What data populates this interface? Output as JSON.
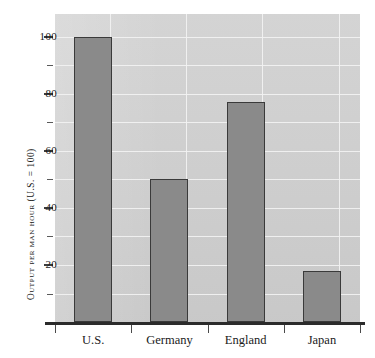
{
  "figure": {
    "top_caption_fragment": "",
    "background_color": "#ffffff",
    "plot_background_color": "#cfcfcf",
    "bar_color": "#8a8a8a",
    "bar_border_color": "#3a3a3a",
    "gridline_color": "#f2f2f2",
    "axis_color": "#2b2b2b"
  },
  "chart_data": {
    "type": "bar",
    "title": "",
    "xlabel": "",
    "ylabel": "Output per man hour (U.S. = 100)",
    "categories": [
      "U.S.",
      "Germany",
      "England",
      "Japan"
    ],
    "values": [
      100,
      50,
      77,
      18
    ],
    "ylim": [
      0,
      108
    ],
    "y_major_ticks": [
      20,
      40,
      60,
      80,
      100
    ],
    "y_minor_ticks": [
      10,
      30,
      50,
      70,
      90
    ],
    "y_tick_labels": [
      "20",
      "40",
      "60",
      "80",
      "100"
    ],
    "gridlines": {
      "horizontal": [
        10,
        20,
        30,
        40,
        50,
        60,
        70,
        80,
        90,
        100
      ],
      "vertical_count": 4,
      "grid": true
    },
    "legend": null,
    "legend_position": "none",
    "annotations": []
  }
}
